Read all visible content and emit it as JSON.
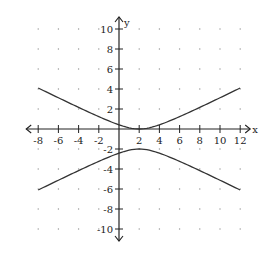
{
  "chart_data": {
    "type": "line",
    "title": "",
    "xlabel": "x",
    "ylabel": "y",
    "xlim": [
      -8,
      12
    ],
    "ylim": [
      -10,
      10
    ],
    "x_ticks": [
      -8,
      -6,
      -4,
      -2,
      2,
      4,
      6,
      8,
      10,
      12
    ],
    "y_ticks": [
      10,
      8,
      6,
      4,
      2,
      -2,
      -4,
      -6,
      -8,
      -10
    ],
    "grid": "dotted points at every 2 units",
    "equation": "(y+1)^2/1 - (x-2)^2/4 = 1",
    "center": [
      2,
      -1
    ],
    "vertices": [
      [
        2,
        0
      ],
      [
        2,
        -2
      ]
    ],
    "series": [
      {
        "name": "upper branch",
        "x": [
          -8,
          -6,
          -4,
          -2,
          0,
          2,
          4,
          6,
          8,
          10,
          12
        ],
        "values": [
          4.1,
          3.12,
          2.16,
          1.24,
          0.41,
          0.0,
          0.41,
          1.24,
          2.16,
          3.12,
          4.1
        ]
      },
      {
        "name": "lower branch",
        "x": [
          -8,
          -6,
          -4,
          -2,
          0,
          2,
          4,
          6,
          8,
          10,
          12
        ],
        "values": [
          -6.1,
          -5.12,
          -4.16,
          -3.24,
          -2.41,
          -2.0,
          -2.41,
          -3.24,
          -4.16,
          -5.12,
          -6.1
        ]
      }
    ]
  },
  "labels": {
    "x_axis": "x",
    "y_axis": "y"
  },
  "colors": {
    "curve": "#333333",
    "axis": "#222222",
    "grid_dot": "#999999"
  }
}
